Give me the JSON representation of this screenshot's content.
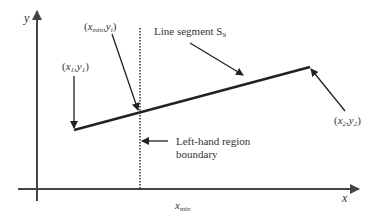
{
  "diagram": {
    "axes": {
      "x_label": "x",
      "y_label": "y"
    },
    "labels": {
      "line_segment": "Line segment S",
      "line_segment_sub": "9",
      "boundary_line1": "Left-hand region",
      "boundary_line2": "boundary",
      "xmin_axis": "x",
      "xmin_axis_sub": "min"
    },
    "points": {
      "p1": {
        "open": "(",
        "x": "x",
        "x_sub": "1",
        "comma": ",",
        "y": "y",
        "y_sub": "1",
        "close": ")"
      },
      "p2": {
        "open": "(",
        "x": "x",
        "x_sub": "2",
        "comma": ",",
        "y": "y",
        "y_sub": "2",
        "close": ")"
      },
      "pi": {
        "open": "(",
        "x": "x",
        "x_sub": "min",
        "comma": ",",
        "y": "y",
        "y_sub": "i",
        "close": ")"
      }
    },
    "colors": {
      "stroke": "#222222",
      "axis": "#444444",
      "text": "#333333"
    }
  }
}
